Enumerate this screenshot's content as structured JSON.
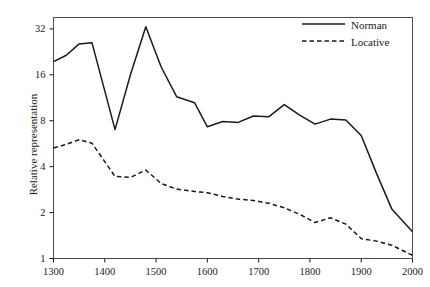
{
  "chart_data": {
    "type": "line",
    "title": "",
    "xlabel": "",
    "ylabel": "Relative representation",
    "xlim": [
      1300,
      2000
    ],
    "ylim": [
      1,
      38
    ],
    "yscale": "log2",
    "grid": false,
    "legend_position": "top-right",
    "xticks": [
      1300,
      1400,
      1500,
      1600,
      1700,
      1800,
      1900,
      2000
    ],
    "yticks": [
      1,
      2,
      4,
      8,
      16,
      32
    ],
    "x": [
      1300,
      1325,
      1350,
      1375,
      1420,
      1450,
      1480,
      1510,
      1540,
      1575,
      1600,
      1630,
      1660,
      1690,
      1720,
      1750,
      1780,
      1810,
      1840,
      1870,
      1900,
      1930,
      1960,
      2000
    ],
    "series": [
      {
        "name": "Norman",
        "style": "solid",
        "color": "#1a1a1a",
        "values": [
          19.5,
          21.5,
          25.5,
          26.0,
          7.0,
          16.0,
          33.0,
          18.0,
          11.5,
          10.5,
          7.3,
          7.9,
          7.8,
          8.6,
          8.5,
          10.2,
          8.7,
          7.6,
          8.2,
          8.1,
          6.4,
          3.6,
          2.1,
          1.5
        ]
      },
      {
        "name": "Locative",
        "style": "dashed",
        "color": "#1a1a1a",
        "values": [
          5.3,
          5.6,
          6.0,
          5.7,
          3.45,
          3.4,
          3.8,
          3.1,
          2.85,
          2.75,
          2.7,
          2.55,
          2.45,
          2.4,
          2.3,
          2.15,
          1.95,
          1.72,
          1.85,
          1.68,
          1.35,
          1.3,
          1.22,
          1.05
        ]
      }
    ],
    "legend": [
      {
        "label": "Norman",
        "style": "solid"
      },
      {
        "label": "Locative",
        "style": "dashed"
      }
    ]
  }
}
